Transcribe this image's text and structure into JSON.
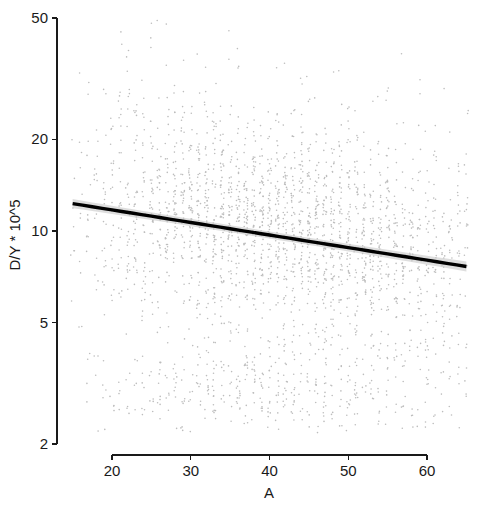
{
  "chart_data": {
    "type": "scatter",
    "title": "",
    "subtitle": "",
    "xlabel": "A",
    "ylabel": "D/Y * 10^5",
    "xlim": [
      14,
      66
    ],
    "ylim": [
      2,
      50
    ],
    "yscale": "log",
    "xscale": "linear",
    "grid": false,
    "legend": null,
    "x_ticks": [
      20,
      30,
      40,
      50,
      60
    ],
    "x_tick_labels": [
      "20",
      "30",
      "40",
      "50",
      "60"
    ],
    "y_ticks": [
      2,
      5,
      10,
      20,
      50
    ],
    "y_tick_labels": [
      "2",
      "5",
      "10",
      "20",
      "50"
    ],
    "point_color": "#bdbdbd",
    "point_size_px": 1.6,
    "point_marker": "dot",
    "n_points_approx": 2600,
    "series": [
      {
        "name": "observations",
        "description": "Dense point cloud, vertical stripes at integer A values; main mass between D/Y 4 and 30, secondary lower cluster between 2.3 and 4.2",
        "color": "#bdbdbd"
      }
    ],
    "annotations": [],
    "fit": {
      "name": "linear fit (log y)",
      "color": "#000000",
      "line_width_px": 3.4,
      "x_start": 15.0,
      "x_end": 65.0,
      "y_start": 12.3,
      "y_end": 7.65,
      "slope_note": "negative slope on log scale",
      "band": {
        "name": "confidence band",
        "color": "#c9c9c9",
        "half_width_y_ratio_start": 1.035,
        "half_width_y_ratio_mid": 1.018,
        "half_width_y_ratio_end": 1.038
      }
    }
  },
  "figure": {
    "background": "#ffffff",
    "width_px": 483,
    "height_px": 512
  }
}
